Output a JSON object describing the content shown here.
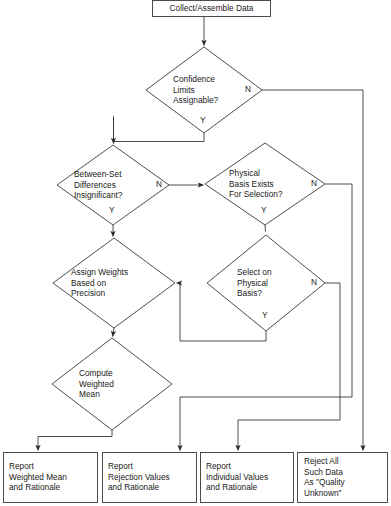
{
  "diagram": {
    "line_color": "#3a3a3a",
    "text_color": "#1a1a1a",
    "background": "#ffffff"
  },
  "nodes": {
    "start": {
      "id": "collect",
      "shape": "process",
      "text": "Collect/Assemble Data"
    },
    "d1": {
      "id": "confidence-limits",
      "shape": "decision",
      "text": "Confidence\nLimits\nAssignable?"
    },
    "d2": {
      "id": "between-set-differences",
      "shape": "decision",
      "text": "Between-Set\nDifferences\nInsignificant?"
    },
    "d3": {
      "id": "physical-basis-exists",
      "shape": "decision",
      "text": "Physical\nBasis Exists\nFor Selection?"
    },
    "d4": {
      "id": "assign-weights",
      "shape": "decision",
      "text": "Assign Weights\nBased on\nPrecision"
    },
    "d5": {
      "id": "select-on-physical-basis",
      "shape": "decision",
      "text": "Select on\nPhysical\nBasis?"
    },
    "d6": {
      "id": "compute-weighted-mean",
      "shape": "decision",
      "text": "Compute\nWeighted\nMean"
    },
    "t1": {
      "id": "report-weighted-mean",
      "shape": "terminal",
      "text": "Report\nWeighted Mean\nand Rationale"
    },
    "t2": {
      "id": "report-rejection-values",
      "shape": "terminal",
      "text": "Report\nRejection Values\nand Rationale"
    },
    "t3": {
      "id": "report-individual-values",
      "shape": "terminal",
      "text": "Report\nIndividual Values\nand Rationale"
    },
    "t4": {
      "id": "reject-all-such-data",
      "shape": "terminal",
      "text": "Reject All\nSuch Data\nAs \"Quality\nUnknown\""
    }
  },
  "branches": {
    "d1_yes": "Y",
    "d1_no": "N",
    "d2_yes": "Y",
    "d2_no": "N",
    "d3_yes": "Y",
    "d3_no": "N",
    "d5_yes": "Y",
    "d5_no": "N"
  },
  "edges": [
    {
      "name": "collect-to-confidence",
      "from": "collect",
      "to": "confidence-limits",
      "label": ""
    },
    {
      "name": "confidence-yes-to-between-set",
      "from": "confidence-limits",
      "to": "between-set-differences",
      "label": "Y"
    },
    {
      "name": "confidence-no-to-reject-all",
      "from": "confidence-limits",
      "to": "reject-all-such-data",
      "label": "N"
    },
    {
      "name": "between-set-yes-to-assign-weights",
      "from": "between-set-differences",
      "to": "assign-weights",
      "label": "Y"
    },
    {
      "name": "between-set-no-to-physical-basis",
      "from": "between-set-differences",
      "to": "physical-basis-exists",
      "label": "N"
    },
    {
      "name": "physical-basis-yes-to-select-on-physical",
      "from": "physical-basis-exists",
      "to": "select-on-physical-basis",
      "label": "Y"
    },
    {
      "name": "physical-basis-no-to-report-rejection",
      "from": "physical-basis-exists",
      "to": "report-rejection-values",
      "label": "N"
    },
    {
      "name": "select-yes-to-assign-weights",
      "from": "select-on-physical-basis",
      "to": "assign-weights",
      "label": "Y"
    },
    {
      "name": "select-no-to-report-individual",
      "from": "select-on-physical-basis",
      "to": "report-individual-values",
      "label": "N"
    },
    {
      "name": "assign-weights-to-compute-mean",
      "from": "assign-weights",
      "to": "compute-weighted-mean",
      "label": ""
    },
    {
      "name": "compute-mean-to-report-weighted-mean",
      "from": "compute-weighted-mean",
      "to": "report-weighted-mean",
      "label": ""
    }
  ]
}
